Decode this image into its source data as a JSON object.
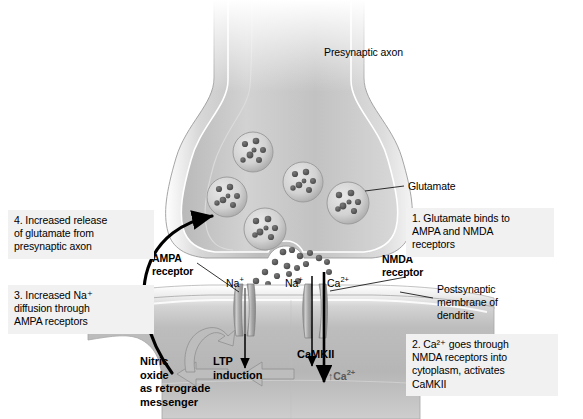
{
  "figure": {
    "colors": {
      "callout_bg": "#f1f1f1",
      "cell_fill_light": "#e3e3e3",
      "cell_fill_mid": "#c9c9c9",
      "cell_fill_dark": "#a8a8a8",
      "vesicle_fill": "#cfcfcf",
      "granule": "#5a5a5a",
      "channel": "#9a9a9a",
      "arrow_black": "#000000",
      "arrow_gray": "#b4b4b4",
      "text": "#000000",
      "text_gray": "#595959",
      "background": "#ffffff"
    }
  },
  "labels": {
    "presynaptic_axon": "Presynaptic axon",
    "glutamate": "Glutamate",
    "ampa_receptor": "AMPA\nreceptor",
    "nmda_receptor": "NMDA\nreceptor",
    "postsynaptic_membrane": "Postsynaptic\nmembrane of\ndendrite"
  },
  "ions": {
    "ampa_na": "Na",
    "ampa_na_charge": "+",
    "nmda_na": "Na",
    "nmda_na_charge": "+",
    "nmda_ca": "Ca",
    "nmda_ca_charge": "2+",
    "cytoplasm_ca_up": "↑Ca",
    "cytoplasm_ca_charge": "2+"
  },
  "cascade": {
    "nitric_oxide": "Nitric\noxide\nas retrograde\nmessenger",
    "ltp_induction": "LTP\ninduction",
    "camkii": "CaMKII"
  },
  "steps": [
    {
      "id": "step-1",
      "text": "1. Glutamate binds to\n    AMPA and NMDA\n    receptors"
    },
    {
      "id": "step-2",
      "text": "2. Ca²⁺  goes through\nNMDA receptors into\ncytoplasm, activates\nCaMKII"
    },
    {
      "id": "step-3",
      "text": "3. Increased Na⁺\n    diffusion through\n    AMPA receptors"
    },
    {
      "id": "step-4",
      "text": "4. Increased release\n    of glutamate from\n    presynaptic axon"
    }
  ],
  "vesicles": [
    {
      "id": "vesicle-1",
      "cx": 253,
      "cy": 152,
      "r": 20
    },
    {
      "id": "vesicle-2",
      "cx": 227,
      "cy": 197,
      "r": 20
    },
    {
      "id": "vesicle-3",
      "cx": 303,
      "cy": 182,
      "r": 20
    },
    {
      "id": "vesicle-4",
      "cx": 265,
      "cy": 229,
      "r": 21
    },
    {
      "id": "vesicle-5",
      "cx": 348,
      "cy": 203,
      "r": 21
    }
  ],
  "channels": [
    {
      "id": "ampa-channel",
      "x": 239,
      "label": "AMPA receptor channel"
    },
    {
      "id": "nmda-channel",
      "x": 311,
      "label": "NMDA receptor channel"
    }
  ]
}
